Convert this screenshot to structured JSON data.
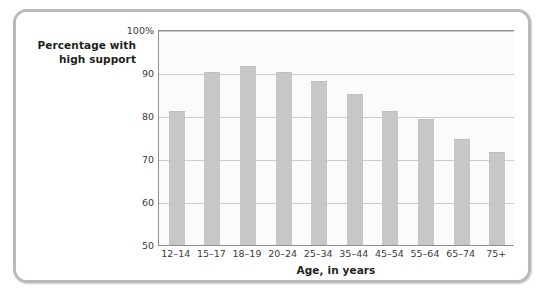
{
  "figure": {
    "y_axis_title_lines": [
      "Percentage with",
      "high support"
    ],
    "x_axis_title": "Age, in years"
  },
  "style": {
    "bar_color": "#c6c8c8",
    "gridline_color": "#c9cbcc",
    "axis_color": "#8d8f90",
    "frame_color": "#b7b9ba",
    "plot_background": "#fbfbfb",
    "page_background": "#ffffff",
    "text_color": "#231f20"
  },
  "chart_data": {
    "type": "bar",
    "title": "",
    "subtitle": "",
    "xlabel": "Age, in years",
    "ylabel": "Percentage with high support",
    "categories": [
      "12–14",
      "15–17",
      "18–19",
      "20–24",
      "25–34",
      "35–44",
      "45–54",
      "55–64",
      "65–74",
      "75+"
    ],
    "values": [
      81,
      90,
      91.5,
      90,
      88,
      85,
      81,
      79,
      74.5,
      71.5
    ],
    "ylim": [
      50,
      100
    ],
    "yticks": [
      50,
      60,
      70,
      80,
      90,
      100
    ],
    "ytick_labels": [
      "50",
      "60",
      "70",
      "80",
      "90",
      "100%"
    ],
    "grid": true,
    "legend": "none",
    "annotations": []
  }
}
